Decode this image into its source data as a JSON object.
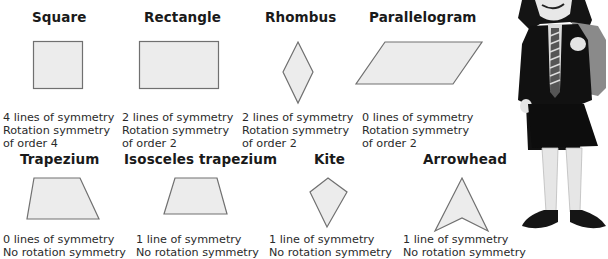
{
  "rows": [
    {
      "shapes": [
        {
          "name": "Square",
          "lines": "4 lines of symmetry",
          "rotation": "Rotation symmetry",
          "order": "of order 4"
        },
        {
          "name": "Rectangle",
          "lines": "2 lines of symmetry",
          "rotation": "Rotation symmetry",
          "order": "of order 2"
        },
        {
          "name": "Rhombus",
          "lines": "2 lines of symmetry",
          "rotation": "Rotation symmetry",
          "order": "of order 2"
        },
        {
          "name": "Parallelogram",
          "lines": "0 lines of symmetry",
          "rotation": "Rotation symmetry",
          "order": "of order 2"
        }
      ]
    },
    {
      "shapes": [
        {
          "name": "Trapezium",
          "lines": "0 lines of symmetry",
          "rotation": "No rotation symmetry"
        },
        {
          "name": "Isosceles trapezium",
          "lines": "1 line of symmetry",
          "rotation": "No rotation symmetry"
        },
        {
          "name": "Kite",
          "lines": "1 line of symmetry",
          "rotation": "No rotation symmetry"
        },
        {
          "name": "Arrowhead",
          "lines": "1 line of symmetry",
          "rotation": "No rotation symmetry"
        }
      ]
    }
  ],
  "colors": {
    "shape_fill": "#ececec",
    "shape_stroke": "#707070",
    "text": "#2a2a2a"
  },
  "illustration": "schoolgirl-with-backpack"
}
